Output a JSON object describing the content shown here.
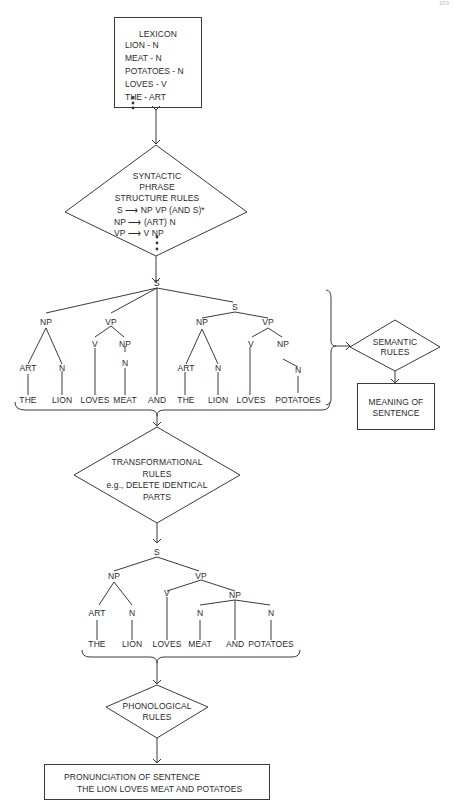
{
  "page_number": "153",
  "lexicon": {
    "title": "LEXICON",
    "entries": [
      "LION - N",
      "MEAT - N",
      "POTATOES - N",
      "LOVES - V",
      "THE - ART"
    ]
  },
  "syntactic_rules": {
    "title_lines": [
      "SYNTACTIC",
      "PHRASE",
      "STRUCTURE RULES"
    ],
    "rules": [
      {
        "lhs": "S",
        "rhs": "NP  VP  (AND S)*"
      },
      {
        "lhs": "NP",
        "rhs": "(ART)  N"
      },
      {
        "lhs": "VP",
        "rhs": "V  NP"
      }
    ]
  },
  "deep_tree": {
    "nodes": {
      "root": "S",
      "np1": "NP",
      "vp1": "VP",
      "art1": "ART",
      "n1": "N",
      "v1": "V",
      "np2": "NP",
      "n2": "N",
      "s2": "S",
      "np3": "NP",
      "vp2": "VP",
      "art2": "ART",
      "n3": "N",
      "v2": "V",
      "np4": "NP",
      "n4": "N"
    },
    "words": [
      "THE",
      "LION",
      "LOVES",
      "MEAT",
      "AND",
      "THE",
      "LION",
      "LOVES",
      "POTATOES"
    ]
  },
  "semantic_rules": {
    "lines": [
      "SEMANTIC",
      "RULES"
    ]
  },
  "meaning": {
    "lines": [
      "MEANING OF",
      "SENTENCE"
    ]
  },
  "transformational_rules": {
    "lines": [
      "TRANSFORMATIONAL",
      "RULES",
      "e.g.,  DELETE IDENTICAL",
      "PARTS"
    ]
  },
  "surface_tree": {
    "nodes": {
      "root": "S",
      "np1": "NP",
      "vp1": "VP",
      "art1": "ART",
      "n1": "N",
      "v1": "V",
      "np2": "NP",
      "n2": "N",
      "n3": "N"
    },
    "words": [
      "THE",
      "LION",
      "LOVES",
      "MEAT",
      "AND",
      "POTATOES"
    ]
  },
  "phonological_rules": {
    "lines": [
      "PHONOLOGICAL",
      "RULES"
    ]
  },
  "pronunciation": {
    "lines": [
      "PRONUNCIATION OF SENTENCE",
      "THE LION LOVES MEAT AND POTATOES"
    ]
  }
}
